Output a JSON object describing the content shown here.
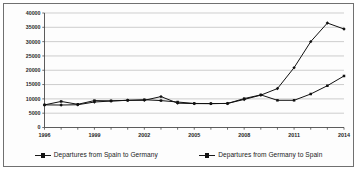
{
  "chart_data": {
    "type": "line",
    "title": "",
    "subtitle": "",
    "xlabel": "",
    "ylabel": "",
    "x": [
      1996,
      1997,
      1998,
      1999,
      2000,
      2001,
      2002,
      2003,
      2004,
      2005,
      2006,
      2007,
      2008,
      2009,
      2010,
      2011,
      2012,
      2013,
      2014
    ],
    "xtick_labels": [
      "1996",
      "",
      "",
      "1999",
      "",
      "",
      "2002",
      "",
      "",
      "2005",
      "",
      "",
      "2008",
      "",
      "",
      "2011",
      "",
      "",
      "2014"
    ],
    "xtick_labels_shown": [
      "1996",
      "1999",
      "2002",
      "2005",
      "2008",
      "2011",
      "2014"
    ],
    "ylim": [
      0,
      40000
    ],
    "ytick_labels": [
      "0",
      "5000",
      "10000",
      "15000",
      "20000",
      "25000",
      "30000",
      "35000",
      "40000"
    ],
    "ytick_values": [
      0,
      5000,
      10000,
      15000,
      20000,
      25000,
      30000,
      35000,
      40000
    ],
    "grid": true,
    "grid_axis": "y",
    "legend_position": "bottom",
    "series": [
      {
        "name": "Departures from Spain to Germany",
        "color": "#111111",
        "marker": "diamond",
        "values": [
          7900,
          7850,
          7950,
          8900,
          9250,
          9500,
          9500,
          10800,
          8500,
          8350,
          8350,
          8400,
          9800,
          11300,
          13600,
          20900,
          30000,
          36500,
          34400
        ]
      },
      {
        "name": "Departures from Germany to Spain",
        "color": "#111111",
        "marker": "square",
        "values": [
          7900,
          9100,
          8100,
          9400,
          9300,
          9500,
          9700,
          9400,
          8900,
          8400,
          8350,
          8400,
          10100,
          11400,
          9500,
          9500,
          11700,
          14600,
          18000
        ]
      }
    ]
  },
  "legend": {
    "entries": [
      {
        "label": "Departures from Spain to Germany"
      },
      {
        "label": "Departures from Germany to Spain"
      }
    ]
  },
  "axes": {
    "y_labels": [
      "40000",
      "35000",
      "30000",
      "25000",
      "20000",
      "15000",
      "10000",
      "5000",
      "0"
    ],
    "x_labels": [
      "1996",
      "1999",
      "2002",
      "2005",
      "2008",
      "2011",
      "2014"
    ]
  }
}
